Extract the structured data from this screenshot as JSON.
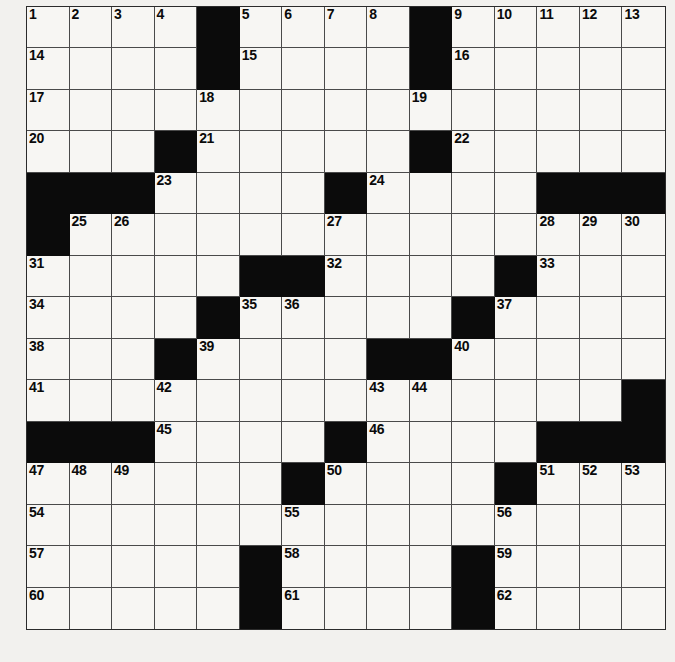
{
  "puzzle": {
    "type": "crossword-grid",
    "rows": 15,
    "cols": 15,
    "colors": {
      "page_background": "#f2f1ee",
      "cell_fill": "#f7f6f3",
      "block_fill": "#0b0b0b",
      "grid_line": "#4a4a4a",
      "number_color": "#0a0a0a"
    },
    "highest_number": 62,
    "grid": [
      [
        {
          "block": false,
          "number": "1"
        },
        {
          "block": false,
          "number": "2"
        },
        {
          "block": false,
          "number": "3"
        },
        {
          "block": false,
          "number": "4"
        },
        {
          "block": true,
          "number": ""
        },
        {
          "block": false,
          "number": "5"
        },
        {
          "block": false,
          "number": "6"
        },
        {
          "block": false,
          "number": "7"
        },
        {
          "block": false,
          "number": "8"
        },
        {
          "block": true,
          "number": ""
        },
        {
          "block": false,
          "number": "9"
        },
        {
          "block": false,
          "number": "10"
        },
        {
          "block": false,
          "number": "11"
        },
        {
          "block": false,
          "number": "12"
        },
        {
          "block": false,
          "number": "13"
        }
      ],
      [
        {
          "block": false,
          "number": "14"
        },
        {
          "block": false,
          "number": ""
        },
        {
          "block": false,
          "number": ""
        },
        {
          "block": false,
          "number": ""
        },
        {
          "block": true,
          "number": ""
        },
        {
          "block": false,
          "number": "15"
        },
        {
          "block": false,
          "number": ""
        },
        {
          "block": false,
          "number": ""
        },
        {
          "block": false,
          "number": ""
        },
        {
          "block": true,
          "number": ""
        },
        {
          "block": false,
          "number": "16"
        },
        {
          "block": false,
          "number": ""
        },
        {
          "block": false,
          "number": ""
        },
        {
          "block": false,
          "number": ""
        },
        {
          "block": false,
          "number": ""
        }
      ],
      [
        {
          "block": false,
          "number": "17"
        },
        {
          "block": false,
          "number": ""
        },
        {
          "block": false,
          "number": ""
        },
        {
          "block": false,
          "number": ""
        },
        {
          "block": false,
          "number": "18"
        },
        {
          "block": false,
          "number": ""
        },
        {
          "block": false,
          "number": ""
        },
        {
          "block": false,
          "number": ""
        },
        {
          "block": false,
          "number": ""
        },
        {
          "block": false,
          "number": "19"
        },
        {
          "block": false,
          "number": ""
        },
        {
          "block": false,
          "number": ""
        },
        {
          "block": false,
          "number": ""
        },
        {
          "block": false,
          "number": ""
        },
        {
          "block": false,
          "number": ""
        }
      ],
      [
        {
          "block": false,
          "number": "20"
        },
        {
          "block": false,
          "number": ""
        },
        {
          "block": false,
          "number": ""
        },
        {
          "block": true,
          "number": ""
        },
        {
          "block": false,
          "number": "21"
        },
        {
          "block": false,
          "number": ""
        },
        {
          "block": false,
          "number": ""
        },
        {
          "block": false,
          "number": ""
        },
        {
          "block": false,
          "number": ""
        },
        {
          "block": true,
          "number": ""
        },
        {
          "block": false,
          "number": "22"
        },
        {
          "block": false,
          "number": ""
        },
        {
          "block": false,
          "number": ""
        },
        {
          "block": false,
          "number": ""
        },
        {
          "block": false,
          "number": ""
        }
      ],
      [
        {
          "block": true,
          "number": ""
        },
        {
          "block": true,
          "number": ""
        },
        {
          "block": true,
          "number": ""
        },
        {
          "block": false,
          "number": "23"
        },
        {
          "block": false,
          "number": ""
        },
        {
          "block": false,
          "number": ""
        },
        {
          "block": false,
          "number": ""
        },
        {
          "block": true,
          "number": ""
        },
        {
          "block": false,
          "number": "24"
        },
        {
          "block": false,
          "number": ""
        },
        {
          "block": false,
          "number": ""
        },
        {
          "block": false,
          "number": ""
        },
        {
          "block": true,
          "number": ""
        },
        {
          "block": true,
          "number": ""
        },
        {
          "block": true,
          "number": ""
        }
      ],
      [
        {
          "block": true,
          "number": ""
        },
        {
          "block": false,
          "number": "25"
        },
        {
          "block": false,
          "number": "26"
        },
        {
          "block": false,
          "number": ""
        },
        {
          "block": false,
          "number": ""
        },
        {
          "block": false,
          "number": ""
        },
        {
          "block": false,
          "number": ""
        },
        {
          "block": false,
          "number": "27"
        },
        {
          "block": false,
          "number": ""
        },
        {
          "block": false,
          "number": ""
        },
        {
          "block": false,
          "number": ""
        },
        {
          "block": false,
          "number": ""
        },
        {
          "block": false,
          "number": "28"
        },
        {
          "block": false,
          "number": "29"
        },
        {
          "block": false,
          "number": "30"
        }
      ],
      [
        {
          "block": false,
          "number": "31"
        },
        {
          "block": false,
          "number": ""
        },
        {
          "block": false,
          "number": ""
        },
        {
          "block": false,
          "number": ""
        },
        {
          "block": false,
          "number": ""
        },
        {
          "block": true,
          "number": ""
        },
        {
          "block": true,
          "number": ""
        },
        {
          "block": false,
          "number": "32"
        },
        {
          "block": false,
          "number": ""
        },
        {
          "block": false,
          "number": ""
        },
        {
          "block": false,
          "number": ""
        },
        {
          "block": true,
          "number": ""
        },
        {
          "block": false,
          "number": "33"
        },
        {
          "block": false,
          "number": ""
        },
        {
          "block": false,
          "number": ""
        }
      ],
      [
        {
          "block": false,
          "number": "34"
        },
        {
          "block": false,
          "number": ""
        },
        {
          "block": false,
          "number": ""
        },
        {
          "block": false,
          "number": ""
        },
        {
          "block": true,
          "number": ""
        },
        {
          "block": false,
          "number": "35"
        },
        {
          "block": false,
          "number": "36"
        },
        {
          "block": false,
          "number": ""
        },
        {
          "block": false,
          "number": ""
        },
        {
          "block": false,
          "number": ""
        },
        {
          "block": true,
          "number": ""
        },
        {
          "block": false,
          "number": "37"
        },
        {
          "block": false,
          "number": ""
        },
        {
          "block": false,
          "number": ""
        },
        {
          "block": false,
          "number": ""
        }
      ],
      [
        {
          "block": false,
          "number": "38"
        },
        {
          "block": false,
          "number": ""
        },
        {
          "block": false,
          "number": ""
        },
        {
          "block": true,
          "number": ""
        },
        {
          "block": false,
          "number": "39"
        },
        {
          "block": false,
          "number": ""
        },
        {
          "block": false,
          "number": ""
        },
        {
          "block": false,
          "number": ""
        },
        {
          "block": true,
          "number": ""
        },
        {
          "block": true,
          "number": ""
        },
        {
          "block": false,
          "number": "40"
        },
        {
          "block": false,
          "number": ""
        },
        {
          "block": false,
          "number": ""
        },
        {
          "block": false,
          "number": ""
        },
        {
          "block": false,
          "number": ""
        }
      ],
      [
        {
          "block": false,
          "number": "41"
        },
        {
          "block": false,
          "number": ""
        },
        {
          "block": false,
          "number": ""
        },
        {
          "block": false,
          "number": "42"
        },
        {
          "block": false,
          "number": ""
        },
        {
          "block": false,
          "number": ""
        },
        {
          "block": false,
          "number": ""
        },
        {
          "block": false,
          "number": ""
        },
        {
          "block": false,
          "number": "43"
        },
        {
          "block": false,
          "number": "44"
        },
        {
          "block": false,
          "number": ""
        },
        {
          "block": false,
          "number": ""
        },
        {
          "block": false,
          "number": ""
        },
        {
          "block": false,
          "number": ""
        },
        {
          "block": true,
          "number": ""
        }
      ],
      [
        {
          "block": true,
          "number": ""
        },
        {
          "block": true,
          "number": ""
        },
        {
          "block": true,
          "number": ""
        },
        {
          "block": false,
          "number": "45"
        },
        {
          "block": false,
          "number": ""
        },
        {
          "block": false,
          "number": ""
        },
        {
          "block": false,
          "number": ""
        },
        {
          "block": true,
          "number": ""
        },
        {
          "block": false,
          "number": "46"
        },
        {
          "block": false,
          "number": ""
        },
        {
          "block": false,
          "number": ""
        },
        {
          "block": false,
          "number": ""
        },
        {
          "block": true,
          "number": ""
        },
        {
          "block": true,
          "number": ""
        },
        {
          "block": true,
          "number": ""
        }
      ],
      [
        {
          "block": false,
          "number": "47"
        },
        {
          "block": false,
          "number": "48"
        },
        {
          "block": false,
          "number": "49"
        },
        {
          "block": false,
          "number": ""
        },
        {
          "block": false,
          "number": ""
        },
        {
          "block": false,
          "number": ""
        },
        {
          "block": true,
          "number": ""
        },
        {
          "block": false,
          "number": "50"
        },
        {
          "block": false,
          "number": ""
        },
        {
          "block": false,
          "number": ""
        },
        {
          "block": false,
          "number": ""
        },
        {
          "block": true,
          "number": ""
        },
        {
          "block": false,
          "number": "51"
        },
        {
          "block": false,
          "number": "52"
        },
        {
          "block": false,
          "number": "53"
        }
      ],
      [
        {
          "block": false,
          "number": "54"
        },
        {
          "block": false,
          "number": ""
        },
        {
          "block": false,
          "number": ""
        },
        {
          "block": false,
          "number": ""
        },
        {
          "block": false,
          "number": ""
        },
        {
          "block": false,
          "number": ""
        },
        {
          "block": false,
          "number": "55"
        },
        {
          "block": false,
          "number": ""
        },
        {
          "block": false,
          "number": ""
        },
        {
          "block": false,
          "number": ""
        },
        {
          "block": false,
          "number": ""
        },
        {
          "block": false,
          "number": "56"
        },
        {
          "block": false,
          "number": ""
        },
        {
          "block": false,
          "number": ""
        },
        {
          "block": false,
          "number": ""
        }
      ],
      [
        {
          "block": false,
          "number": "57"
        },
        {
          "block": false,
          "number": ""
        },
        {
          "block": false,
          "number": ""
        },
        {
          "block": false,
          "number": ""
        },
        {
          "block": false,
          "number": ""
        },
        {
          "block": true,
          "number": ""
        },
        {
          "block": false,
          "number": "58"
        },
        {
          "block": false,
          "number": ""
        },
        {
          "block": false,
          "number": ""
        },
        {
          "block": false,
          "number": ""
        },
        {
          "block": true,
          "number": ""
        },
        {
          "block": false,
          "number": "59"
        },
        {
          "block": false,
          "number": ""
        },
        {
          "block": false,
          "number": ""
        },
        {
          "block": false,
          "number": ""
        }
      ],
      [
        {
          "block": false,
          "number": "60"
        },
        {
          "block": false,
          "number": ""
        },
        {
          "block": false,
          "number": ""
        },
        {
          "block": false,
          "number": ""
        },
        {
          "block": false,
          "number": ""
        },
        {
          "block": true,
          "number": ""
        },
        {
          "block": false,
          "number": "61"
        },
        {
          "block": false,
          "number": ""
        },
        {
          "block": false,
          "number": ""
        },
        {
          "block": false,
          "number": ""
        },
        {
          "block": true,
          "number": ""
        },
        {
          "block": false,
          "number": "62"
        },
        {
          "block": false,
          "number": ""
        },
        {
          "block": false,
          "number": ""
        },
        {
          "block": false,
          "number": ""
        }
      ]
    ]
  }
}
